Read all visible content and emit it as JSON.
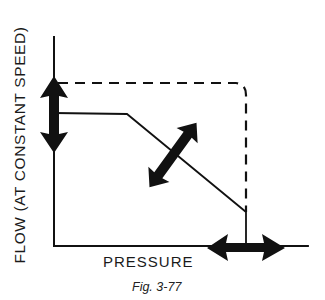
{
  "figure": {
    "caption": "Fig. 3-77",
    "y_axis_label": "FLOW (AT CONSTANT SPEED)",
    "x_axis_label": "PRESSURE",
    "colors": {
      "line": "#111111",
      "background": "#ffffff"
    },
    "curves": [
      {
        "name": "maximum-displacement-dashed",
        "style": "dashed",
        "points": [
          [
            54,
            83
          ],
          [
            236,
            83
          ],
          [
            246,
            93
          ],
          [
            246,
            212
          ]
        ]
      },
      {
        "name": "pressure-compensated-flow",
        "style": "solid",
        "points": [
          [
            54,
            113
          ],
          [
            127,
            113
          ],
          [
            246,
            212
          ],
          [
            246,
            246
          ]
        ]
      }
    ],
    "arrows": [
      {
        "name": "flow-adjust-arrow",
        "orientation": "vertical",
        "from": [
          54,
          78
        ],
        "to": [
          54,
          152
        ]
      },
      {
        "name": "slope-adjust-arrow",
        "orientation": "diagonal",
        "from": [
          150,
          187
        ],
        "to": [
          196,
          123
        ]
      },
      {
        "name": "pressure-adjust-arrow",
        "orientation": "horizontal",
        "from": [
          208,
          247
        ],
        "to": [
          284,
          247
        ]
      }
    ]
  }
}
